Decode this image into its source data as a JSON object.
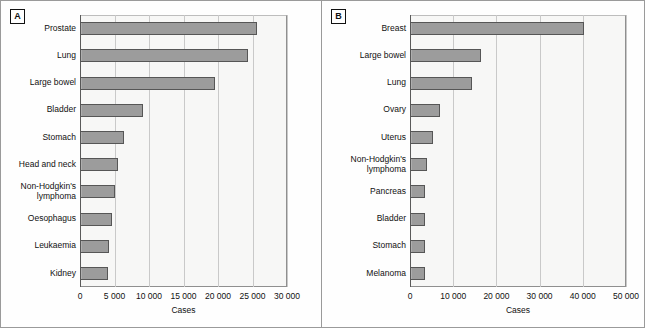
{
  "figure": {
    "background": "#fdfdfc",
    "bar_fill": "#9c9c9c",
    "bar_stroke": "#565656",
    "grid_color": "#c9c9c9"
  },
  "panels": [
    {
      "letter": "A",
      "xlabel": "Cases",
      "tick_labels": [
        "0",
        "5000",
        "10000",
        "15000",
        "20000",
        "25000",
        "30000"
      ]
    },
    {
      "letter": "B",
      "xlabel": "Cases",
      "tick_labels": [
        "0",
        "10000",
        "20000",
        "30000",
        "40000",
        "50000"
      ]
    }
  ],
  "chart_data": [
    {
      "type": "bar",
      "title": "A",
      "orientation": "horizontal",
      "xlabel": "Cases",
      "ylabel": "",
      "xlim": [
        0,
        30000
      ],
      "xticks": [
        0,
        5000,
        10000,
        15000,
        20000,
        25000,
        30000
      ],
      "xticklabels": [
        "0",
        "5000",
        "10000",
        "15000",
        "20000",
        "25000",
        "30000"
      ],
      "grid": true,
      "legend": null,
      "categories": [
        "Prostate",
        "Lung",
        "Large bowel",
        "Bladder",
        "Stomach",
        "Head and neck",
        "Non-Hodgkin's\nlymphoma",
        "Oesophagus",
        "Leukaemia",
        "Kidney"
      ],
      "values": [
        25600,
        24300,
        19600,
        9100,
        6400,
        5500,
        5000,
        4600,
        4250,
        4000
      ]
    },
    {
      "type": "bar",
      "title": "B",
      "orientation": "horizontal",
      "xlabel": "Cases",
      "ylabel": "",
      "xlim": [
        0,
        50000
      ],
      "xticks": [
        0,
        10000,
        20000,
        30000,
        40000,
        50000
      ],
      "xticklabels": [
        "0",
        "10000",
        "20000",
        "30000",
        "40000",
        "50000"
      ],
      "grid": true,
      "legend": null,
      "categories": [
        "Breast",
        "Large bowel",
        "Lung",
        "Ovary",
        "Uterus",
        "Non-Hodgkin's\nlymphoma",
        "Pancreas",
        "Bladder",
        "Stomach",
        "Melanoma"
      ],
      "values": [
        40200,
        16500,
        14400,
        7000,
        5400,
        4000,
        3500,
        3500,
        3400,
        3400
      ]
    }
  ]
}
